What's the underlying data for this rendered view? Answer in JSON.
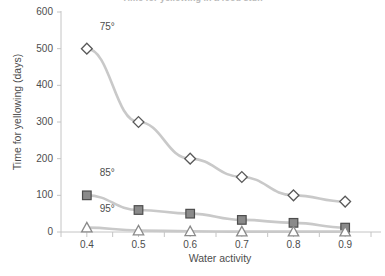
{
  "chart_data": {
    "type": "line",
    "title": "Time for yellowing in a food stuff",
    "xlabel": "Water activity",
    "ylabel": "Time for yellowing (days)",
    "x": [
      0.4,
      0.5,
      0.6,
      0.7,
      0.8,
      0.9
    ],
    "xtick_labels": [
      "0.4",
      "0.5",
      "0.6",
      "0.7",
      "0.8",
      "0.9"
    ],
    "ytick_labels": [
      "0",
      "100",
      "200",
      "300",
      "400",
      "500",
      "600"
    ],
    "yticks": [
      0,
      100,
      200,
      300,
      400,
      500,
      600
    ],
    "xlim": [
      0.35,
      0.95
    ],
    "ylim": [
      0,
      600
    ],
    "grid": false,
    "legend_position": "inline-annotation",
    "series": [
      {
        "name": "75°",
        "label": "75°",
        "marker": "diamond-open",
        "marker_fill": "#ffffff",
        "marker_stroke": "#595959",
        "line_color": "#c9c9c9",
        "label_x": 0.425,
        "label_y": 560,
        "values": [
          500,
          300,
          200,
          150,
          100,
          83
        ]
      },
      {
        "name": "85°",
        "label": "85°",
        "marker": "square-filled",
        "marker_fill": "#8a8a8a",
        "marker_stroke": "#4d4d4d",
        "line_color": "#c9c9c9",
        "label_x": 0.425,
        "label_y": 162,
        "values": [
          100,
          60,
          50,
          33,
          25,
          12
        ]
      },
      {
        "name": "95°",
        "label": "95°",
        "marker": "triangle-open",
        "marker_fill": "#ffffff",
        "marker_stroke": "#8a8a8a",
        "line_color": "#c9c9c9",
        "label_x": 0.425,
        "label_y": 62,
        "values": [
          12,
          4,
          2,
          1,
          1,
          1
        ]
      }
    ],
    "colors": {
      "axis": "#c4c4c4",
      "tick": "#c4c4c4",
      "text": "#4d4d4d",
      "line": "#c9c9c9",
      "background": "#ffffff"
    }
  }
}
